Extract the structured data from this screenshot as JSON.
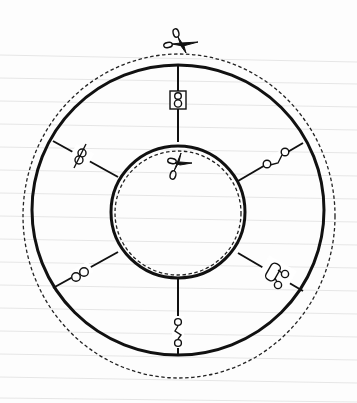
{
  "diagram": {
    "colors": {
      "line": "#111111",
      "paper": "#fdfdfd",
      "rule_lines": "#e6e6e6"
    },
    "outer_ring": {
      "center": [
        178,
        209
      ],
      "solid_radius": 146,
      "dashed_cut_radius": 155
    },
    "inner_ring": {
      "center": [
        178,
        209
      ],
      "solid_radius": 68,
      "dashed_cut_radius": 64
    },
    "scissors": [
      {
        "position": "top of outer dashed cut line",
        "icon": "scissors-icon"
      },
      {
        "position": "top of inner dashed cut line",
        "icon": "scissors-icon"
      }
    ],
    "spokes": [
      {
        "angle_deg": 90,
        "symbol": "boxed-figure-eight",
        "icon": "boxed-eight-icon"
      },
      {
        "angle_deg": 30,
        "symbol": "two-connected-circles",
        "icon": "connected-circles-icon"
      },
      {
        "angle_deg": -30,
        "symbol": "rounded-rect-with-two-circles",
        "icon": "rect-with-circles-icon"
      },
      {
        "angle_deg": -90,
        "symbol": "zigzag-two-circles",
        "icon": "zigzag-circles-icon"
      },
      {
        "angle_deg": 210,
        "symbol": "overlapping-circles",
        "icon": "overlapping-circles-icon"
      },
      {
        "angle_deg": 150,
        "symbol": "stacked-crossed-circles",
        "icon": "crossed-circles-icon"
      }
    ]
  }
}
